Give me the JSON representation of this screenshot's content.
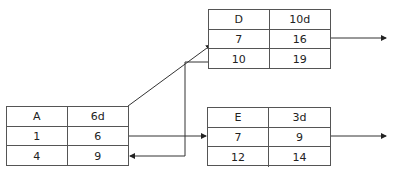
{
  "nodes": {
    "A": {
      "name": "A",
      "duration": "6d",
      "es": "1",
      "ef": "6",
      "ls": "4",
      "lf": "9"
    },
    "D": {
      "name": "D",
      "duration": "10d",
      "es": "7",
      "ef": "16",
      "ls": "10",
      "lf": "19"
    },
    "E": {
      "name": "E",
      "duration": "3d",
      "es": "7",
      "ef": "9",
      "ls": "12",
      "lf": "14"
    }
  },
  "colors": {
    "line": "#333333",
    "border": "#555555",
    "background": "#ffffff"
  }
}
